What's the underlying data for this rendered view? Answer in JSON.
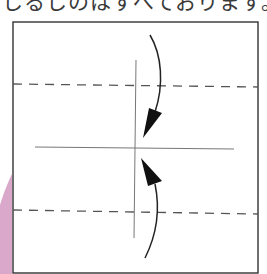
{
  "caption": "しるしのはすべております。",
  "diagram": {
    "paper_border_color": "#333333",
    "fold_line_color": "#555555",
    "guide_line_color": "#777777",
    "arrow_color": "#111111",
    "accent_shape_color": "#d9a8cb",
    "fold_lines": [
      {
        "type": "valley-dashed",
        "position": "upper"
      },
      {
        "type": "valley-dashed",
        "position": "lower"
      }
    ],
    "guide_lines": [
      {
        "type": "center-horizontal"
      },
      {
        "type": "center-vertical"
      }
    ],
    "arrows": [
      {
        "direction": "down",
        "label": "fold-top-edge-to-center"
      },
      {
        "direction": "up",
        "label": "fold-bottom-edge-to-center"
      }
    ]
  }
}
